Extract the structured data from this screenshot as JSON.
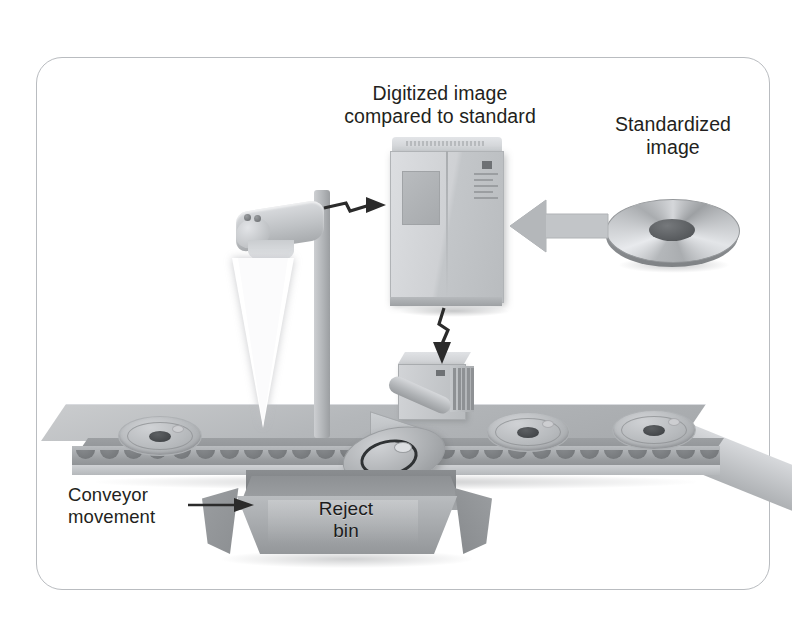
{
  "diagram": {
    "title_alt": "Machine vision inspection system on a conveyor",
    "frame": {
      "border_color": "#b9bcc0"
    }
  },
  "labels": {
    "digitized": "Digitized image\ncompared to standard",
    "standardized": "Standardized\nimage",
    "conveyor": "Conveyor\nmovement",
    "reject_bin": "Reject\nbin"
  },
  "components": {
    "camera": "camera-scanner",
    "light_beam": "light-beam",
    "computer": "computer-tower",
    "disc_media": "standardized-image-disc",
    "robot_arm": "reject-arm",
    "conveyor": "conveyor-belt",
    "bin": "reject-bin"
  },
  "parts_on_belt": [
    {
      "id": "part-1",
      "state": "inspected"
    },
    {
      "id": "part-2",
      "state": "incoming"
    },
    {
      "id": "part-3",
      "state": "incoming"
    },
    {
      "id": "part-4",
      "state": "rejected"
    }
  ],
  "arrows": [
    {
      "id": "camera-to-computer",
      "style": "zigzag",
      "direction": "right"
    },
    {
      "id": "computer-to-arm",
      "style": "zigzag",
      "direction": "down"
    },
    {
      "id": "disc-to-computer",
      "style": "block",
      "direction": "left"
    },
    {
      "id": "conveyor-direction",
      "style": "thin",
      "direction": "right"
    }
  ],
  "colors": {
    "metal_light": "#d9dbde",
    "metal_mid": "#b4b7ba",
    "metal_dark": "#8a8d90",
    "ink": "#231f20",
    "frame": "#b9bcc0",
    "beam": "#ffffff"
  }
}
